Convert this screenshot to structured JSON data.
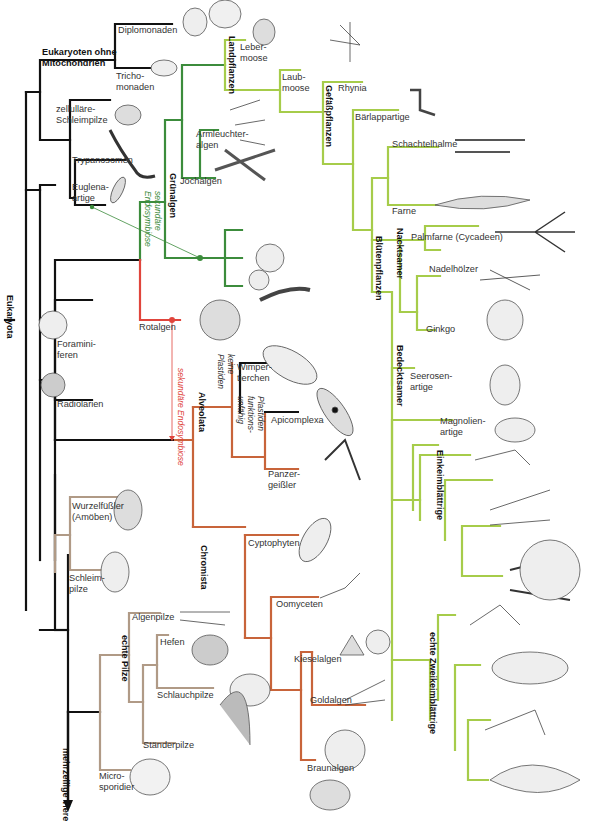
{
  "diagram": {
    "title": "Eukaryota",
    "colors": {
      "black": "#111111",
      "dark_green": "#3c8c3c",
      "light_green": "#a6cc4a",
      "red": "#e0453c",
      "orange": "#c8643a",
      "tan": "#b09a86"
    },
    "groups": {
      "eukaryota": "Eukaryota",
      "ohne_mito": "Eukaryoten ohne\nMitochondrien",
      "gruenalgen": "Grünalgen",
      "landpflanzen": "Landpflanzen",
      "gefaesspflanzen": "Gefäßpflanzen",
      "bluetenpflanzen": "Blütenpflanzen",
      "nacktsamer": "Nacktsamer",
      "bedecktsamer": "Bedecktsamer",
      "einkeimblaettrige": "Einkeimblättrige",
      "zweikeimblaettrige": "echte  Zweikeimblättrige",
      "alveolata": "Alveolata",
      "chromista": "Chromista",
      "echte_pilze": "echte Pilze",
      "tiere": "mehrzellige\nTiere"
    },
    "annotations": {
      "sek_endo_green": "sekundäre\nEndosymbiose",
      "sek_endo_red": "sekundäre Endosymbiose",
      "keine_plastiden": "keine\nPlastiden",
      "plastiden_funktionsunfaehig": "Plastiden\nfunktions-\nunfähig"
    },
    "taxa": {
      "diplomonaden": "Diplomonaden",
      "trichomonaden": "Tricho-\nmonaden",
      "schleimpilze_zell": "zellulläre-\nSchleimpilze",
      "trypanosomen": "Trypanosomen",
      "euglena": "Euglena-\nartige",
      "lebermoose": "Leber-\nmoose",
      "laubmoose": "Laub-\nmoose",
      "armleuchter": "Armleuchter-\nalgen",
      "jochalgen": "Jochalgen",
      "rhynia": "Rhynia",
      "baerlapp": "Bärlappartige",
      "schachtelhalme": "Schachtelhalme",
      "farne": "Farne",
      "palmfarne": "Palmfarne (Cycadeen)",
      "nadelhoelzer": "Nadelhölzer",
      "ginkgo": "Ginkgo",
      "seerosen": "Seerosen-\nartige",
      "magnolien": "Magnolien-\nartige",
      "rotalgen": "Rotalgen",
      "foraminiferen": "Foramini-\nferen",
      "radiolarien": "Radiolarien",
      "wimpertierchen": "Wimper-\ntierchen",
      "apicomplexa": "Apicomplexa",
      "panzergeissler": "Panzer-\ngeißler",
      "wurzelfuessler": "Wurzelfüßler\n(Amöben)",
      "schleimpilze": "Schleim-\npilze",
      "cyptophyten": "Cyptophyten",
      "oomyceten": "Oomyceten",
      "kieselalgen": "Kieselalgen",
      "goldalgen": "Goldalgen",
      "braunalgen": "Braunalgen",
      "algenpilze": "Algenpilze",
      "hefen": "Hefen",
      "schlauchpilze": "Schlauchpilze",
      "staenderpilze": "Ständerpilze",
      "microsporidier": "Micro-\nsporidier"
    }
  }
}
